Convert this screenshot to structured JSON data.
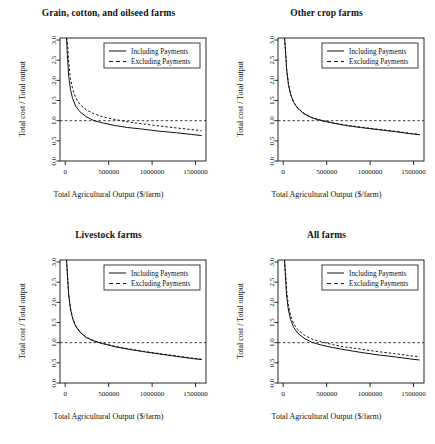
{
  "figure": {
    "background": "#ffffff",
    "panel_count": 4,
    "shared": {
      "xlabel": "Total Agricultural Output ($/farm)",
      "ylabel": "Total cost / Total output",
      "xticks": [
        0,
        500000,
        1000000,
        1500000
      ],
      "xtick_labels": [
        "0",
        "500000",
        "1000000",
        "1500000"
      ],
      "yticks": [
        0.0,
        0.5,
        1.0,
        1.5,
        2.0,
        2.5,
        3.0
      ],
      "ytick_labels": [
        "0.0",
        "0.5",
        "1.0",
        "1.5",
        "2.0",
        "2.5",
        "3.0"
      ],
      "xlim": [
        -60000,
        1620000
      ],
      "ylim": [
        0.0,
        3.05
      ],
      "reference_line_y": 1.0,
      "legend_entries": [
        {
          "label": "Including Payments",
          "style": "solid"
        },
        {
          "label": "Excluding Payments",
          "style": "dashed"
        }
      ],
      "line_color": "#111111",
      "grid": false,
      "legend_position": "top-right-inside"
    }
  },
  "chart_data": [
    {
      "type": "line",
      "title": "Grain, cotton, and oilseed farms",
      "xlabel": "Total Agricultural Output ($/farm)",
      "ylabel": "Total cost / Total output",
      "xlim": [
        -60000,
        1620000
      ],
      "ylim": [
        0.0,
        3.05
      ],
      "grid": false,
      "legend_position": "top-right-inside",
      "reference_line_y": 1.0,
      "x": [
        15000,
        25000,
        40000,
        60000,
        85000,
        120000,
        170000,
        240000,
        330000,
        440000,
        570000,
        720000,
        890000,
        1080000,
        1280000,
        1450000,
        1570000
      ],
      "series": [
        {
          "name": "Including Payments",
          "style": "solid",
          "values": [
            3.05,
            2.62,
            2.1,
            1.78,
            1.55,
            1.36,
            1.22,
            1.1,
            1.0,
            0.94,
            0.88,
            0.83,
            0.79,
            0.74,
            0.7,
            0.66,
            0.63
          ]
        },
        {
          "name": "Excluding Payments",
          "style": "dashed",
          "values": [
            3.05,
            2.95,
            2.45,
            2.05,
            1.79,
            1.57,
            1.4,
            1.27,
            1.17,
            1.09,
            1.03,
            0.97,
            0.92,
            0.87,
            0.82,
            0.78,
            0.75
          ]
        }
      ]
    },
    {
      "type": "line",
      "title": "Other crop farms",
      "xlabel": "Total Agricultural Output ($/farm)",
      "ylabel": "Total cost / Total output",
      "xlim": [
        -60000,
        1620000
      ],
      "ylim": [
        0.0,
        3.05
      ],
      "grid": false,
      "legend_position": "top-right-inside",
      "reference_line_y": 1.0,
      "x": [
        15000,
        25000,
        40000,
        60000,
        85000,
        120000,
        170000,
        240000,
        330000,
        440000,
        570000,
        720000,
        890000,
        1080000,
        1280000,
        1450000,
        1570000
      ],
      "series": [
        {
          "name": "Including Payments",
          "style": "solid",
          "values": [
            3.05,
            2.78,
            2.25,
            1.9,
            1.65,
            1.45,
            1.3,
            1.17,
            1.07,
            1.0,
            0.94,
            0.88,
            0.83,
            0.78,
            0.73,
            0.68,
            0.65
          ]
        },
        {
          "name": "Excluding Payments",
          "style": "dashed",
          "values": [
            3.05,
            2.8,
            2.27,
            1.92,
            1.66,
            1.46,
            1.31,
            1.18,
            1.08,
            1.01,
            0.95,
            0.89,
            0.84,
            0.79,
            0.74,
            0.69,
            0.66
          ]
        }
      ]
    },
    {
      "type": "line",
      "title": "Livestock farms",
      "xlabel": "Total Agricultural Output ($/farm)",
      "ylabel": "Total cost / Total output",
      "xlim": [
        -60000,
        1620000
      ],
      "ylim": [
        0.0,
        3.05
      ],
      "grid": false,
      "legend_position": "top-right-inside",
      "reference_line_y": 1.0,
      "x": [
        15000,
        25000,
        40000,
        60000,
        85000,
        120000,
        170000,
        240000,
        330000,
        440000,
        570000,
        720000,
        890000,
        1080000,
        1280000,
        1450000,
        1570000
      ],
      "series": [
        {
          "name": "Including Payments",
          "style": "solid",
          "values": [
            3.05,
            2.7,
            2.18,
            1.84,
            1.6,
            1.41,
            1.26,
            1.13,
            1.04,
            0.97,
            0.9,
            0.84,
            0.78,
            0.72,
            0.66,
            0.61,
            0.58
          ]
        },
        {
          "name": "Excluding Payments",
          "style": "dashed",
          "values": [
            3.05,
            2.72,
            2.2,
            1.86,
            1.61,
            1.42,
            1.27,
            1.14,
            1.05,
            0.98,
            0.91,
            0.85,
            0.79,
            0.73,
            0.67,
            0.62,
            0.59
          ]
        }
      ]
    },
    {
      "type": "line",
      "title": "All farms",
      "xlabel": "Total Agricultural Output ($/farm)",
      "ylabel": "Total cost / Total output",
      "xlim": [
        -60000,
        1620000
      ],
      "ylim": [
        0.0,
        3.05
      ],
      "grid": false,
      "legend_position": "top-right-inside",
      "reference_line_y": 1.0,
      "x": [
        15000,
        25000,
        40000,
        60000,
        85000,
        120000,
        170000,
        240000,
        330000,
        440000,
        570000,
        720000,
        890000,
        1080000,
        1280000,
        1450000,
        1570000
      ],
      "series": [
        {
          "name": "Including Payments",
          "style": "solid",
          "values": [
            3.05,
            2.66,
            2.14,
            1.81,
            1.57,
            1.38,
            1.23,
            1.11,
            1.01,
            0.94,
            0.88,
            0.82,
            0.76,
            0.7,
            0.65,
            0.6,
            0.57
          ]
        },
        {
          "name": "Excluding Payments",
          "style": "dashed",
          "values": [
            3.05,
            2.8,
            2.28,
            1.93,
            1.67,
            1.47,
            1.32,
            1.19,
            1.09,
            1.02,
            0.95,
            0.89,
            0.84,
            0.78,
            0.73,
            0.68,
            0.65
          ]
        }
      ]
    }
  ]
}
